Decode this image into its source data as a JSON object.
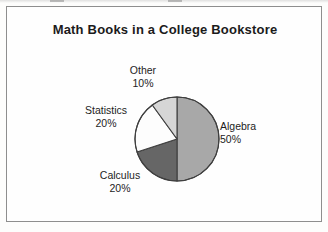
{
  "frame": {
    "border_color": "#8e8e8e",
    "background": "#fefefe"
  },
  "chart_data": {
    "type": "pie",
    "title": "Math Books in a College Bookstore",
    "xlabel": "",
    "ylabel": "",
    "legend_position": "none",
    "grid": false,
    "start_angle_deg": 0,
    "direction": "clockwise",
    "categories": [
      "Algebra",
      "Calculus",
      "Statistics",
      "Other"
    ],
    "values": [
      50,
      20,
      20,
      10
    ],
    "value_unit": "%",
    "slices": [
      {
        "label": "Algebra",
        "value": 50,
        "percent_text": "50%",
        "color": "#a8a8a8",
        "stroke": "#3f3f3f",
        "label_position": "right"
      },
      {
        "label": "Calculus",
        "value": 20,
        "percent_text": "20%",
        "color": "#666666",
        "stroke": "#3f3f3f",
        "label_position": "bottom-left"
      },
      {
        "label": "Statistics",
        "value": 20,
        "percent_text": "20%",
        "color": "#fdfdfd",
        "stroke": "#3f3f3f",
        "label_position": "left"
      },
      {
        "label": "Other",
        "value": 10,
        "percent_text": "10%",
        "color": "#d6d6d6",
        "stroke": "#3f3f3f",
        "label_position": "top"
      }
    ]
  }
}
